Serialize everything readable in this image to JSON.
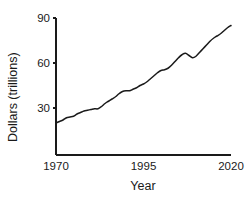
{
  "chart_data": {
    "type": "line",
    "title": "",
    "xlabel": "Year",
    "ylabel": "Dollars (trillions)",
    "xlim": [
      1970,
      2020
    ],
    "ylim": [
      0,
      90
    ],
    "xticks": [
      1970,
      1995,
      2020
    ],
    "xtick_labels": [
      "1970",
      "1995",
      "2020"
    ],
    "yticks": [
      30,
      60,
      90
    ],
    "ytick_labels": [
      "30",
      "60",
      "90"
    ],
    "grid": false,
    "legend": false,
    "line_color": "#1a1a1a",
    "series": [
      {
        "name": "Dollars (trillions)",
        "x": [
          1970,
          1971,
          1972,
          1973,
          1974,
          1975,
          1976,
          1977,
          1978,
          1979,
          1980,
          1981,
          1982,
          1983,
          1984,
          1985,
          1986,
          1987,
          1988,
          1989,
          1990,
          1991,
          1992,
          1993,
          1994,
          1995,
          1996,
          1997,
          1998,
          1999,
          2000,
          2001,
          2002,
          2003,
          2004,
          2005,
          2006,
          2007,
          2008,
          2009,
          2010,
          2011,
          2012,
          2013,
          2014,
          2015,
          2016,
          2017,
          2018,
          2019,
          2020
        ],
        "values": [
          20.0,
          21.0,
          22.0,
          23.5,
          24.0,
          24.5,
          26.0,
          27.0,
          28.0,
          28.5,
          29.0,
          29.5,
          29.5,
          31.0,
          33.0,
          34.5,
          36.0,
          37.5,
          39.5,
          41.0,
          41.5,
          41.5,
          42.5,
          43.5,
          45.0,
          46.0,
          47.5,
          49.5,
          51.5,
          53.5,
          55.0,
          55.5,
          56.5,
          58.5,
          61.0,
          63.5,
          65.5,
          66.5,
          65.0,
          63.5,
          64.5,
          67.0,
          69.5,
          72.0,
          74.5,
          76.5,
          78.0,
          79.5,
          81.5,
          83.5,
          85.0
        ]
      }
    ]
  },
  "axes": {
    "ytick_0": "30",
    "ytick_1": "60",
    "ytick_2": "90",
    "xtick_0": "1970",
    "xtick_1": "1995",
    "xtick_2": "2020",
    "ylabel": "Dollars (trillions)",
    "xlabel": "Year"
  }
}
